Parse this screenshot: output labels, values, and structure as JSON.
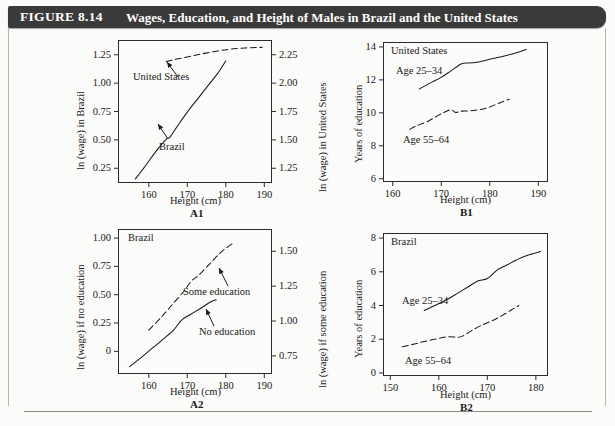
{
  "header": {
    "figure_number": "FIGURE 8.14",
    "title": "Wages, Education, and Height of Males in Brazil and the United States",
    "bar_color": "#3a3a3a"
  },
  "chart_data": [
    {
      "id": "A1",
      "panel_label": "A1",
      "type": "line",
      "title": "",
      "xlabel": "Height (cm)",
      "ylabel": "ln (wage) in Brazil",
      "y2label": "ln (wage) in United States",
      "xlim": [
        152,
        192
      ],
      "xticks": [
        160,
        170,
        180,
        190
      ],
      "ylim": [
        0.12,
        1.38
      ],
      "yticks": [
        0.25,
        0.5,
        0.75,
        1.0,
        1.25
      ],
      "ytick_labels": [
        "0.25",
        "0.50",
        "0.75",
        "1.00",
        "1.25"
      ],
      "y2lim": [
        1.12,
        2.38
      ],
      "y2ticks": [
        1.25,
        1.5,
        1.75,
        2.0,
        2.25
      ],
      "y2tick_labels": [
        "1.25",
        "1.50",
        "1.75",
        "2.00",
        "2.25"
      ],
      "grid": false,
      "legend_position": "inline-annotations",
      "series": [
        {
          "name": "Brazil",
          "style": "solid",
          "axis": "left",
          "x": [
            156.5,
            159.0,
            162.0,
            164.5,
            165.5,
            167.5,
            170.0,
            173.0,
            176.0,
            178.0,
            180.0
          ],
          "y": [
            0.155,
            0.265,
            0.405,
            0.505,
            0.525,
            0.625,
            0.745,
            0.875,
            1.005,
            1.09,
            1.195
          ]
        },
        {
          "name": "United States",
          "style": "dashed",
          "axis": "right",
          "x": [
            164.5,
            167.0,
            170.0,
            173.0,
            176.0,
            179.0,
            182.0,
            185.0,
            188.0,
            189.5
          ],
          "y": [
            2.19,
            2.21,
            2.23,
            2.252,
            2.272,
            2.29,
            2.302,
            2.31,
            2.314,
            2.316
          ]
        }
      ],
      "annotations": [
        {
          "text": "United States",
          "for": "United States"
        },
        {
          "text": "Brazil",
          "for": "Brazil"
        }
      ]
    },
    {
      "id": "B1",
      "panel_label": "B1",
      "type": "line",
      "title": "",
      "corner_note": "United States",
      "xlabel": "Height (cm)",
      "ylabel": "Years of education",
      "xlim": [
        158,
        192
      ],
      "xticks": [
        160,
        170,
        180,
        190
      ],
      "ylim": [
        5.8,
        14.3
      ],
      "yticks": [
        6,
        8,
        10,
        12,
        14
      ],
      "ytick_labels": [
        "6",
        "8",
        "10",
        "12",
        "14"
      ],
      "grid": false,
      "legend_position": "inline-annotations",
      "series": [
        {
          "name": "Age 25–34",
          "style": "solid",
          "axis": "left",
          "x": [
            165.5,
            168.0,
            170.0,
            172.0,
            174.0,
            175.0,
            177.0,
            180.0,
            183.0,
            185.5,
            187.5
          ],
          "y": [
            11.45,
            11.85,
            12.15,
            12.55,
            12.95,
            13.02,
            13.05,
            13.25,
            13.45,
            13.65,
            13.85
          ]
        },
        {
          "name": "Age 55–64",
          "style": "dashed",
          "axis": "left",
          "x": [
            163.5,
            165.0,
            167.0,
            169.0,
            170.5,
            172.0,
            173.0,
            174.0,
            176.0,
            178.0,
            180.0,
            182.0,
            184.0
          ],
          "y": [
            9.0,
            9.22,
            9.45,
            9.78,
            10.02,
            10.18,
            10.02,
            10.1,
            10.12,
            10.2,
            10.35,
            10.6,
            10.82
          ]
        }
      ],
      "annotations": [
        {
          "text": "Age 25–34",
          "for": "Age 25–34"
        },
        {
          "text": "Age 55–64",
          "for": "Age 55–64"
        }
      ]
    },
    {
      "id": "A2",
      "panel_label": "A2",
      "type": "line",
      "title": "",
      "corner_note": "Brazil",
      "xlabel": "Height (cm)",
      "ylabel": "ln (wage) if no education",
      "y2label": "ln (wage) if some education",
      "xlim": [
        152,
        192
      ],
      "xticks": [
        160,
        170,
        180,
        190
      ],
      "ylim": [
        -0.2,
        1.08
      ],
      "yticks": [
        0,
        0.25,
        0.5,
        0.75,
        1.0
      ],
      "ytick_labels": [
        "0",
        "0.25",
        "0.50",
        "0.75",
        "1.00"
      ],
      "y2lim": [
        0.62,
        1.66
      ],
      "y2ticks": [
        0.75,
        1.0,
        1.25,
        1.5
      ],
      "y2tick_labels": [
        "0.75",
        "1.00",
        "1.25",
        "1.50"
      ],
      "grid": false,
      "legend_position": "inline-annotations",
      "series": [
        {
          "name": "No education",
          "style": "solid",
          "axis": "left",
          "x": [
            155.0,
            158.0,
            161.0,
            164.0,
            166.5,
            168.5,
            171.0,
            173.5,
            176.0,
            177.5
          ],
          "y": [
            -0.135,
            -0.055,
            0.03,
            0.115,
            0.19,
            0.275,
            0.33,
            0.38,
            0.435,
            0.455
          ]
        },
        {
          "name": "Some education",
          "style": "dashed",
          "axis": "right",
          "x": [
            160.0,
            163.0,
            166.0,
            169.0,
            171.0,
            173.0,
            176.0,
            179.0,
            182.0
          ],
          "y": [
            0.935,
            1.02,
            1.115,
            1.21,
            1.285,
            1.33,
            1.415,
            1.5,
            1.56
          ]
        }
      ],
      "annotations": [
        {
          "text": "Some education",
          "for": "Some education"
        },
        {
          "text": "No education",
          "for": "No education"
        }
      ]
    },
    {
      "id": "B2",
      "panel_label": "B2",
      "type": "line",
      "title": "",
      "corner_note": "Brazil",
      "xlabel": "Height (cm)",
      "ylabel": "Years of education",
      "xlim": [
        148.5,
        182.5
      ],
      "xticks": [
        150,
        160,
        170,
        180
      ],
      "ylim": [
        -0.18,
        8.3
      ],
      "yticks": [
        0,
        2,
        4,
        6,
        8
      ],
      "ytick_labels": [
        "0",
        "2",
        "4",
        "6",
        "8"
      ],
      "grid": false,
      "legend_position": "inline-annotations",
      "series": [
        {
          "name": "Age 25–34",
          "style": "solid",
          "axis": "left",
          "x": [
            157.0,
            159.5,
            162.0,
            164.0,
            166.0,
            168.0,
            170.0,
            172.0,
            174.0,
            176.0,
            178.0,
            181.0
          ],
          "y": [
            3.7,
            4.05,
            4.4,
            4.75,
            5.1,
            5.45,
            5.6,
            6.1,
            6.4,
            6.7,
            6.95,
            7.2
          ]
        },
        {
          "name": "Age 55–64",
          "style": "dashed",
          "axis": "left",
          "x": [
            152.5,
            155.0,
            157.5,
            160.0,
            162.0,
            164.0,
            165.0,
            167.0,
            169.0,
            171.0,
            173.0,
            175.0,
            176.5
          ],
          "y": [
            1.55,
            1.72,
            1.9,
            2.05,
            2.15,
            2.12,
            2.2,
            2.55,
            2.85,
            3.1,
            3.4,
            3.75,
            4.0
          ]
        }
      ],
      "annotations": [
        {
          "text": "Age 25–34",
          "for": "Age 25–34"
        },
        {
          "text": "Age 55–64",
          "for": "Age 55–64"
        }
      ]
    }
  ]
}
